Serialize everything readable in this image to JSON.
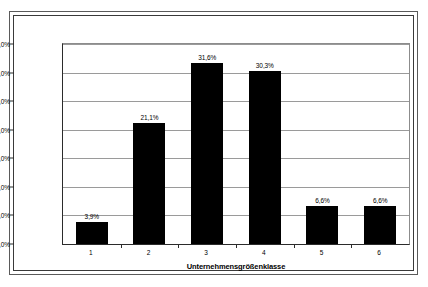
{
  "chart_data": {
    "type": "bar",
    "title": "",
    "subtitle": "",
    "xlabel": "Unternehmensgrößenklasse",
    "ylabel": "",
    "categories": [
      "1",
      "2",
      "3",
      "4",
      "5",
      "6"
    ],
    "values": [
      3.9,
      21.1,
      31.6,
      30.3,
      6.6,
      6.6
    ],
    "value_labels": [
      "3,9%",
      "21,1%",
      "31,6%",
      "30,3%",
      "6,6%",
      "6,6%"
    ],
    "ylim": [
      0,
      35
    ],
    "ytick_values": [
      0,
      5,
      10,
      15,
      20,
      25,
      30,
      35
    ],
    "ytick_labels": [
      "0,0%",
      "5,0%",
      "10,0%",
      "15,0%",
      "20,0%",
      "25,0%",
      "30,0%",
      "35,0%"
    ],
    "grid": true,
    "grid_axis": "y",
    "legend": false,
    "legend_position": "none",
    "series": [
      {
        "name": "Anteil",
        "values": [
          3.9,
          21.1,
          31.6,
          30.3,
          6.6,
          6.6
        ]
      }
    ],
    "colors": {
      "bar": "#000000",
      "plot_background": "#ffffff",
      "gridline": "#9a9a9a",
      "axis": "#2b2b2b",
      "frame": "#3a3a3a",
      "text": "#000000"
    }
  }
}
